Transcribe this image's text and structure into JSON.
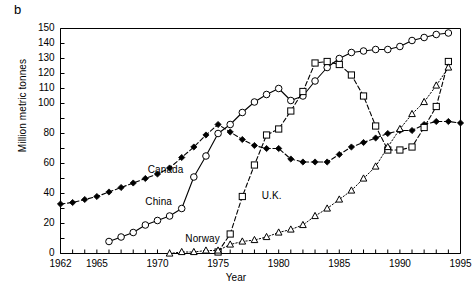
{
  "figure": {
    "panel_letter": "b",
    "xlabel": "Year",
    "ylabel": "Million metric tonnes"
  },
  "chart_data": {
    "type": "line",
    "title": "",
    "xlabel": "Year",
    "ylabel": "Million metric tonnes",
    "xlim": [
      1962,
      1995
    ],
    "ylim": [
      0,
      150
    ],
    "grid": false,
    "legend": "inline-annotations",
    "xticks": [
      1962,
      1963,
      1964,
      1965,
      1966,
      1967,
      1968,
      1969,
      1970,
      1971,
      1972,
      1973,
      1974,
      1975,
      1976,
      1977,
      1978,
      1979,
      1980,
      1981,
      1982,
      1983,
      1984,
      1985,
      1986,
      1987,
      1988,
      1989,
      1990,
      1991,
      1992,
      1993,
      1994,
      1995
    ],
    "xtick_labels": [
      "1962",
      "1965",
      "1970",
      "1975",
      "1980",
      "1985",
      "1990",
      "1995"
    ],
    "xtick_label_values": [
      1962,
      1965,
      1970,
      1975,
      1980,
      1985,
      1990,
      1995
    ],
    "yticks": [
      0,
      10,
      20,
      30,
      40,
      50,
      60,
      70,
      80,
      90,
      100,
      110,
      120,
      130,
      140,
      150
    ],
    "ytick_labels": [
      "0",
      "20",
      "40",
      "60",
      "80",
      "100",
      "110",
      "120",
      "130",
      "140",
      "150"
    ],
    "ytick_label_values": [
      0,
      20,
      40,
      60,
      80,
      100,
      110,
      120,
      130,
      140,
      150
    ],
    "series": [
      {
        "name": "Canada",
        "marker": "filled-diamond",
        "linestyle": "dashed",
        "color": "#000000",
        "label_x": 1969.2,
        "label_y": 55,
        "x": [
          1962,
          1963,
          1964,
          1965,
          1966,
          1967,
          1968,
          1969,
          1970,
          1971,
          1972,
          1973,
          1974,
          1975,
          1976,
          1977,
          1978,
          1979,
          1980,
          1981,
          1982,
          1983,
          1984,
          1985,
          1986,
          1987,
          1988,
          1989,
          1990,
          1991,
          1992,
          1993,
          1994,
          1995
        ],
        "y": [
          33,
          34,
          36,
          38,
          41,
          44,
          47,
          50,
          53,
          57,
          64,
          71,
          79,
          86,
          81,
          76,
          72,
          70,
          70,
          63,
          61,
          61,
          61,
          66,
          71,
          74,
          77,
          80,
          82,
          82,
          86,
          88,
          88,
          87
        ],
        "y_note": "values read from chart; series peaks near 86 in 1975 then dips to ~61 in 1982-1984 and rises to ~88 by 1993"
      },
      {
        "name": "China",
        "marker": "open-circle",
        "linestyle": "solid",
        "color": "#000000",
        "label_x": 1969.0,
        "label_y": 34,
        "x": [
          1966,
          1967,
          1968,
          1969,
          1970,
          1971,
          1972,
          1973,
          1974,
          1975,
          1976,
          1977,
          1978,
          1979,
          1980,
          1981,
          1982,
          1983,
          1984,
          1985,
          1986,
          1987,
          1988,
          1989,
          1990,
          1991,
          1992,
          1993,
          1994
        ],
        "y": [
          8,
          11,
          14,
          19,
          22,
          25,
          30,
          51,
          65,
          80,
          86,
          94,
          101,
          106,
          110,
          102,
          105,
          115,
          124,
          130,
          134,
          135,
          136,
          136,
          138,
          142,
          144,
          146,
          147
        ],
        "y_note": "open-circle solid curve rising from ~8 in 1966 to ~147 in 1994"
      },
      {
        "name": "U.K.",
        "marker": "open-square",
        "linestyle": "dashed",
        "color": "#000000",
        "label_x": 1978.6,
        "label_y": 38,
        "x": [
          1975,
          1976,
          1977,
          1978,
          1979,
          1980,
          1981,
          1982,
          1983,
          1984,
          1985,
          1986,
          1987,
          1988,
          1989,
          1990,
          1991,
          1992,
          1993,
          1994
        ],
        "y": [
          1,
          13,
          38,
          59,
          79,
          83,
          95,
          108,
          127,
          128,
          126,
          119,
          105,
          85,
          69,
          69,
          71,
          84,
          98,
          128
        ],
        "y_note": "open-square dashed curve; peaks ~128 in 1983-84, collapses to ~69 in 1989-90, rises again to ~128 in 1994"
      },
      {
        "name": "Norway",
        "marker": "open-triangle",
        "linestyle": "dotted",
        "color": "#000000",
        "label_x": 1972.3,
        "label_y": 9,
        "x": [
          1971,
          1972,
          1973,
          1974,
          1975,
          1976,
          1977,
          1978,
          1979,
          1980,
          1981,
          1982,
          1983,
          1984,
          1985,
          1986,
          1987,
          1988,
          1989,
          1990,
          1991,
          1992,
          1993,
          1994
        ],
        "y": [
          0,
          1,
          1,
          2,
          2,
          6,
          8,
          9,
          11,
          14,
          16,
          19,
          25,
          30,
          36,
          42,
          50,
          58,
          71,
          83,
          93,
          101,
          112,
          124
        ],
        "y_note": "open-triangle dotted curve from ~0 in 1971 climbing steadily to ~124 in 1994"
      }
    ]
  }
}
